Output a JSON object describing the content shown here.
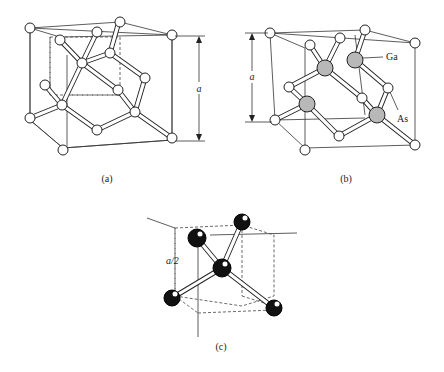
{
  "figure": {
    "panels": [
      {
        "id": "a",
        "caption": "(a)",
        "description": "Diamond lattice unit cell",
        "dimension_label": "a"
      },
      {
        "id": "b",
        "caption": "(b)",
        "description": "Zincblende (GaAs) lattice unit cell",
        "dimension_label": "a",
        "atom_labels": [
          "Ga",
          "As"
        ]
      },
      {
        "id": "c",
        "caption": "(c)",
        "description": "Tetrahedral bond configuration",
        "dimension_label": "a/2"
      }
    ]
  }
}
